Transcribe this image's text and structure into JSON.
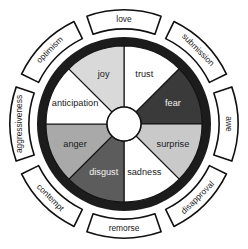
{
  "diagram": {
    "center": {
      "x": 124,
      "y": 124
    },
    "hub_radius": 17,
    "inner_radius": 78,
    "ring_outer_radius": 87,
    "colors": {
      "background": "#ffffff",
      "outline": "#101010",
      "outer_ring": "#1c1c1c",
      "banner_fill": "#ffffff",
      "text_dark": "#1a1a1a",
      "text_light": "#f2f2f2"
    },
    "emotions": [
      {
        "label": "joy",
        "fill": "#d9d9d9",
        "text_tone": "dark",
        "start_angle": -90,
        "end_angle": -45,
        "label_radius": 53,
        "label_angle": -67.5
      },
      {
        "label": "trust",
        "fill": "#ffffff",
        "text_tone": "dark",
        "start_angle": -90,
        "end_angle": -45,
        "label_radius": 53,
        "label_angle": -22.5,
        "_mirror": "right-of-top"
      },
      {
        "label": "fear",
        "fill": "#3a3a3a",
        "text_tone": "light",
        "start_angle": -45,
        "end_angle": 0,
        "label_radius": 53,
        "label_angle": 22.5
      },
      {
        "label": "surprise",
        "fill": "#c9c9c9",
        "text_tone": "dark",
        "start_angle": 0,
        "end_angle": 45,
        "label_radius": 53,
        "label_angle": 67.5
      },
      {
        "label": "sadness",
        "fill": "#ffffff",
        "text_tone": "dark",
        "start_angle": 45,
        "end_angle": 90,
        "label_radius": 53,
        "label_angle": 112.5
      },
      {
        "label": "disgust",
        "fill": "#5c5c5c",
        "text_tone": "light",
        "start_angle": 90,
        "end_angle": 135,
        "label_radius": 53,
        "label_angle": 157.5
      },
      {
        "label": "anger",
        "fill": "#a9a9a9",
        "text_tone": "dark",
        "start_angle": 135,
        "end_angle": 180,
        "label_radius": 53,
        "label_angle": 202.5
      },
      {
        "label": "anticipation",
        "fill": "#ffffff",
        "text_tone": "dark",
        "start_angle": 180,
        "end_angle": 225,
        "label_radius": 53,
        "label_angle": 247.5
      }
    ],
    "dyads": [
      {
        "label": "love",
        "angle": 0,
        "rotation": 0
      },
      {
        "label": "submission",
        "angle": 45,
        "rotation": 45
      },
      {
        "label": "awe",
        "angle": 90,
        "rotation": 90
      },
      {
        "label": "disapproval",
        "angle": 135,
        "rotation": 135
      },
      {
        "label": "remorse",
        "angle": 180,
        "rotation": 0
      },
      {
        "label": "contempt",
        "angle": 225,
        "rotation": 45
      },
      {
        "label": "aggressiveness",
        "angle": 270,
        "rotation": 90
      },
      {
        "label": "optimism",
        "angle": 315,
        "rotation": 135
      }
    ]
  }
}
